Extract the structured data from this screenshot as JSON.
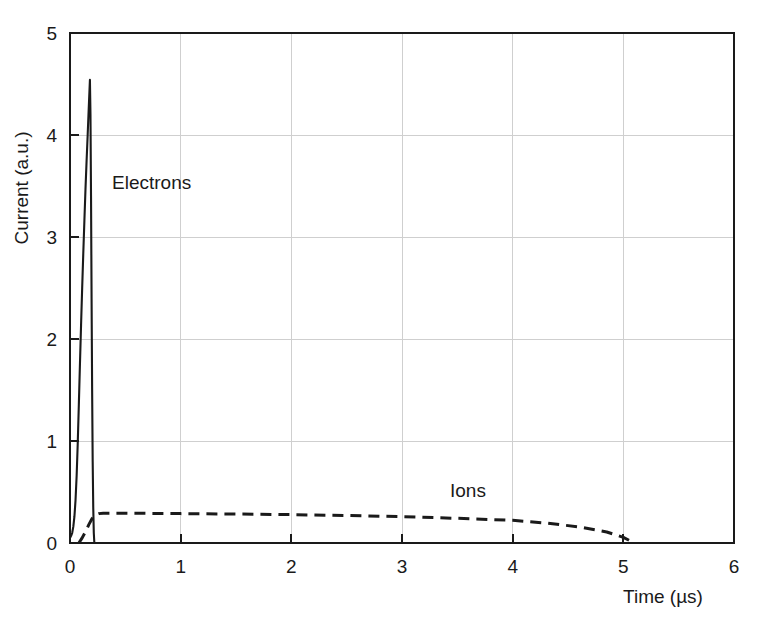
{
  "chart_data": {
    "type": "line",
    "title": "",
    "xlabel": "Time (µs)",
    "ylabel": "Current (a.u.)",
    "xlim": [
      0,
      6
    ],
    "ylim": [
      0,
      5
    ],
    "xticks": [
      "0",
      "1",
      "2",
      "3",
      "4",
      "5",
      "6"
    ],
    "yticks": [
      "0",
      "1",
      "2",
      "3",
      "4",
      "5"
    ],
    "xtick_values": [
      0,
      1,
      2,
      3,
      4,
      5,
      6
    ],
    "ytick_values": [
      0,
      1,
      2,
      3,
      4,
      5
    ],
    "grid": true,
    "legend_position": "inline-annotations",
    "series": [
      {
        "name": "Electrons",
        "style": "solid",
        "color": "#1a1a1a",
        "annotation": "Electrons",
        "annotation_x": 0.38,
        "annotation_y": 3.55,
        "peak_x": 0.18,
        "peak_y": 4.54,
        "x": [
          0.0,
          0.01,
          0.02,
          0.03,
          0.04,
          0.05,
          0.06,
          0.07,
          0.08,
          0.09,
          0.1,
          0.11,
          0.12,
          0.13,
          0.14,
          0.15,
          0.16,
          0.17,
          0.18,
          0.185,
          0.19,
          0.195,
          0.2,
          0.205,
          0.21,
          0.215,
          0.22,
          6.0
        ],
        "y": [
          0.05,
          0.07,
          0.1,
          0.16,
          0.26,
          0.42,
          0.66,
          0.98,
          1.36,
          1.76,
          2.14,
          2.5,
          2.84,
          3.16,
          3.47,
          3.75,
          4.01,
          4.28,
          4.54,
          4.2,
          3.4,
          2.4,
          1.5,
          0.8,
          0.35,
          0.1,
          0.0,
          0.0
        ]
      },
      {
        "name": "Ions",
        "style": "dashed",
        "color": "#1a1a1a",
        "annotation": "Ions",
        "annotation_x": 3.43,
        "annotation_y": 0.62,
        "plateau_y": 0.29,
        "end_x": 5.1,
        "x": [
          0.08,
          0.11,
          0.14,
          0.17,
          0.2,
          0.23,
          0.26,
          0.3,
          0.5,
          1.0,
          1.5,
          2.0,
          2.5,
          3.0,
          3.5,
          4.0,
          4.3,
          4.6,
          4.85,
          5.0,
          5.1
        ],
        "y": [
          0.0,
          0.05,
          0.11,
          0.18,
          0.24,
          0.275,
          0.288,
          0.292,
          0.292,
          0.288,
          0.284,
          0.278,
          0.27,
          0.258,
          0.242,
          0.222,
          0.196,
          0.158,
          0.108,
          0.055,
          0.0
        ]
      }
    ]
  },
  "axes": {
    "x_label": "Time (µs)",
    "y_label": "Current (a.u.)",
    "x_tick_labels": [
      "0",
      "1",
      "2",
      "3",
      "4",
      "5",
      "6"
    ],
    "y_tick_labels": [
      "0",
      "1",
      "2",
      "3",
      "4",
      "5"
    ]
  },
  "annotations": {
    "electrons": "Electrons",
    "ions": "Ions"
  },
  "colors": {
    "line": "#1a1a1a",
    "grid": "#cfcfcf",
    "background": "#ffffff"
  }
}
